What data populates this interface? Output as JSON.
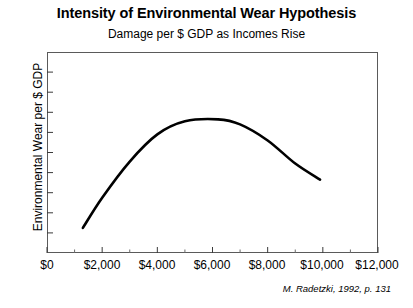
{
  "chart_data": {
    "type": "line",
    "title": "Intensity of Environmental Wear Hypothesis",
    "subtitle": "Damage per $ GDP as Incomes Rise",
    "xlabel": "",
    "ylabel": "Environmental Wear per $ GDP",
    "xlim": [
      0,
      12000
    ],
    "ylim": [
      0,
      1
    ],
    "grid": false,
    "legend": null,
    "xticklabels": [
      "$0",
      "$2,000",
      "$4,000",
      "$6,000",
      "$8,000",
      "$10,000",
      "$12,000"
    ],
    "xticks": [
      0,
      2000,
      4000,
      6000,
      8000,
      10000,
      12000
    ],
    "x_minor_tick_interval": 1000,
    "yticklabels": [],
    "y_tick_count": 9,
    "annotation": "M. Radetzki, 1992, p. 131",
    "series": [
      {
        "name": "Environmental wear intensity",
        "color": "#000000",
        "x": [
          1300,
          2000,
          3000,
          4000,
          5000,
          6200,
          7000,
          8000,
          9000,
          9900
        ],
        "y": [
          0.125,
          0.275,
          0.455,
          0.59,
          0.655,
          0.665,
          0.64,
          0.56,
          0.445,
          0.365
        ]
      }
    ]
  },
  "axis": {
    "x_tick_labels": [
      {
        "label": "$0",
        "pos": 47
      },
      {
        "label": "$2,000",
        "pos": 102
      },
      {
        "label": "$4,000",
        "pos": 157
      },
      {
        "label": "$6,000",
        "pos": 212
      },
      {
        "label": "$8,000",
        "pos": 267
      },
      {
        "label": "$10,000",
        "pos": 322
      },
      {
        "label": "$12,000",
        "pos": 377
      }
    ]
  }
}
